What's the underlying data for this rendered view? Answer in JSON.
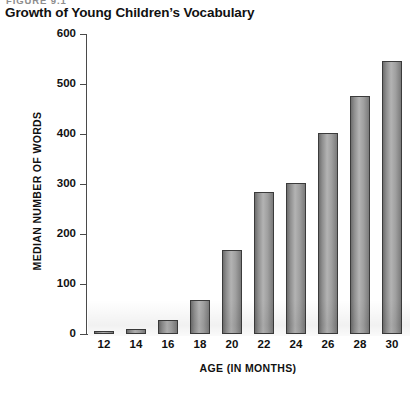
{
  "figure": {
    "label": "FIGURE 9.1",
    "title": "Growth of Young Children’s Vocabulary"
  },
  "chart_data": {
    "type": "bar",
    "title": "Growth of Young Children’s Vocabulary",
    "xlabel": "AGE (IN MONTHS)",
    "ylabel": "MEDIAN NUMBER OF WORDS",
    "categories": [
      "12",
      "14",
      "16",
      "18",
      "20",
      "22",
      "24",
      "26",
      "28",
      "30"
    ],
    "values": [
      5,
      10,
      28,
      68,
      168,
      285,
      302,
      402,
      476,
      546
    ],
    "ylim": [
      0,
      600
    ],
    "yticks": [
      0,
      100,
      200,
      300,
      400,
      500,
      600
    ],
    "ytick_labels": [
      "0",
      "100",
      "200",
      "300",
      "400",
      "500",
      "600"
    ],
    "grid": false,
    "legend": false,
    "bar_color": "#a0a0a0",
    "bar_edge_color": "#3b3b3b",
    "axis_color": "#4a4a4a"
  }
}
